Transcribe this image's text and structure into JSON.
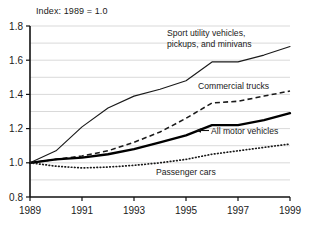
{
  "chart_data": {
    "type": "line",
    "title": "Index: 1989 = 1.0",
    "xlabel": "",
    "ylabel": "",
    "xlim": [
      1989,
      1999
    ],
    "ylim": [
      0.8,
      1.8
    ],
    "yticks": [
      "0.8",
      "1.0",
      "1.2",
      "1.4",
      "1.6",
      "1.8"
    ],
    "ytick_values": [
      0.8,
      1.0,
      1.2,
      1.4,
      1.6,
      1.8
    ],
    "xticks": [
      "1989",
      "1991",
      "1993",
      "1995",
      "1997",
      "1999"
    ],
    "xtick_values": [
      1989,
      1991,
      1993,
      1995,
      1997,
      1999
    ],
    "minor_xticks": [
      1990,
      1992,
      1994,
      1996,
      1998
    ],
    "grid": "horizontal-minor-0.1",
    "legend_position": "inline-annotations",
    "x": [
      1989,
      1990,
      1991,
      1992,
      1993,
      1994,
      1995,
      1996,
      1997,
      1998,
      1999
    ],
    "series": [
      {
        "name": "Sport utility vehicles, pickups, and minivans",
        "style": "thin-solid",
        "color": "#1a1a1a",
        "values": [
          1.0,
          1.07,
          1.21,
          1.32,
          1.39,
          1.43,
          1.48,
          1.59,
          1.59,
          1.63,
          1.68
        ]
      },
      {
        "name": "Commercial trucks",
        "style": "dashed",
        "color": "#1a1a1a",
        "values": [
          1.0,
          1.02,
          1.04,
          1.07,
          1.12,
          1.18,
          1.26,
          1.35,
          1.36,
          1.39,
          1.42
        ]
      },
      {
        "name": "All motor vehicles",
        "style": "thick-solid",
        "color": "#000000",
        "values": [
          1.0,
          1.02,
          1.03,
          1.05,
          1.08,
          1.12,
          1.16,
          1.22,
          1.22,
          1.25,
          1.29
        ]
      },
      {
        "name": "Passenger cars",
        "style": "dotted",
        "color": "#1a1a1a",
        "values": [
          1.0,
          0.98,
          0.97,
          0.975,
          0.985,
          1.0,
          1.02,
          1.05,
          1.07,
          1.09,
          1.11
        ]
      }
    ],
    "annotations": [
      {
        "id": "suv",
        "text_lines": [
          "Sport utility vehicles,",
          "pickups, and minivans"
        ],
        "x": 167,
        "y": 36
      },
      {
        "id": "commercial-trucks",
        "text_lines": [
          "Commercial trucks"
        ],
        "x": 198,
        "y": 89
      },
      {
        "id": "all-motor-vehicles",
        "text_lines": [
          "All motor vehicles"
        ],
        "x": 211,
        "y": 133,
        "has_leader_arrow": true
      },
      {
        "id": "passenger-cars",
        "text_lines": [
          "Passenger cars"
        ],
        "x": 156,
        "y": 175
      }
    ]
  }
}
